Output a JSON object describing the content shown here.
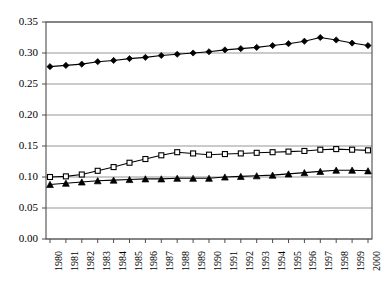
{
  "chart_data": {
    "type": "line",
    "title": "",
    "subtitle": "",
    "xlabel": "",
    "ylabel": "",
    "grid": true,
    "legend_position": "none",
    "xlim": [
      1980,
      2000
    ],
    "ylim": [
      0.0,
      0.35
    ],
    "ytick_labels": [
      "0.35",
      "0.30",
      "0.25",
      "0.20",
      "0.15",
      "0.10",
      "0.05",
      "0.00"
    ],
    "ytick_values": [
      0.35,
      0.3,
      0.25,
      0.2,
      0.15,
      0.1,
      0.05,
      0.0
    ],
    "categories": [
      "1980",
      "1981",
      "1982",
      "1983",
      "1984",
      "1985",
      "1986",
      "1987",
      "1988",
      "1989",
      "1990",
      "1991",
      "1992",
      "1993",
      "1994",
      "1995",
      "1996",
      "1997",
      "1998",
      "1999",
      "2000"
    ],
    "x": [
      1980,
      1981,
      1982,
      1983,
      1984,
      1985,
      1986,
      1987,
      1988,
      1989,
      1990,
      1991,
      1992,
      1993,
      1994,
      1995,
      1996,
      1997,
      1998,
      1999,
      2000
    ],
    "series": [
      {
        "name": "series-diamond",
        "marker": "filled-diamond",
        "color": "#000000",
        "values": [
          0.278,
          0.28,
          0.282,
          0.286,
          0.288,
          0.291,
          0.293,
          0.296,
          0.298,
          0.3,
          0.302,
          0.305,
          0.307,
          0.309,
          0.312,
          0.315,
          0.319,
          0.325,
          0.321,
          0.316,
          0.312
        ]
      },
      {
        "name": "series-square",
        "marker": "open-square",
        "color": "#000000",
        "values": [
          0.1,
          0.101,
          0.104,
          0.11,
          0.116,
          0.123,
          0.129,
          0.135,
          0.14,
          0.138,
          0.136,
          0.137,
          0.138,
          0.139,
          0.14,
          0.141,
          0.142,
          0.144,
          0.145,
          0.144,
          0.143
        ]
      },
      {
        "name": "series-triangle",
        "marker": "filled-triangle",
        "color": "#000000",
        "values": [
          0.088,
          0.09,
          0.092,
          0.094,
          0.095,
          0.096,
          0.097,
          0.097,
          0.098,
          0.098,
          0.098,
          0.1,
          0.101,
          0.102,
          0.103,
          0.105,
          0.107,
          0.109,
          0.111,
          0.111,
          0.11
        ]
      }
    ]
  },
  "axes": {
    "plot_left": 46,
    "plot_right": 372,
    "plot_top": 22,
    "plot_bottom": 239
  }
}
